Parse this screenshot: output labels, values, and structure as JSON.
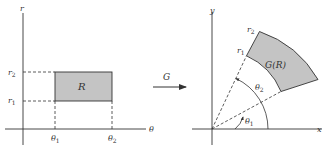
{
  "left_panel": {
    "vertical_axis_label": "r",
    "horizontal_axis_label": "θ",
    "region_label": "R",
    "r_ticks": [
      {
        "base": "r",
        "sub": "2"
      },
      {
        "base": "r",
        "sub": "1"
      }
    ],
    "theta_ticks": [
      {
        "base": "θ",
        "sub": "1"
      },
      {
        "base": "θ",
        "sub": "2"
      }
    ]
  },
  "mapping": {
    "label": "G"
  },
  "right_panel": {
    "vertical_axis_label": "y",
    "horizontal_axis_label": "x",
    "region_label": "G(R)",
    "radius_labels": [
      {
        "base": "r",
        "sub": "2"
      },
      {
        "base": "r",
        "sub": "1"
      }
    ],
    "angle_labels": [
      {
        "base": "θ",
        "sub": "2"
      },
      {
        "base": "θ",
        "sub": "1"
      }
    ]
  },
  "colors": {
    "region_fill": "#c4c4c4",
    "line": "#333333"
  }
}
